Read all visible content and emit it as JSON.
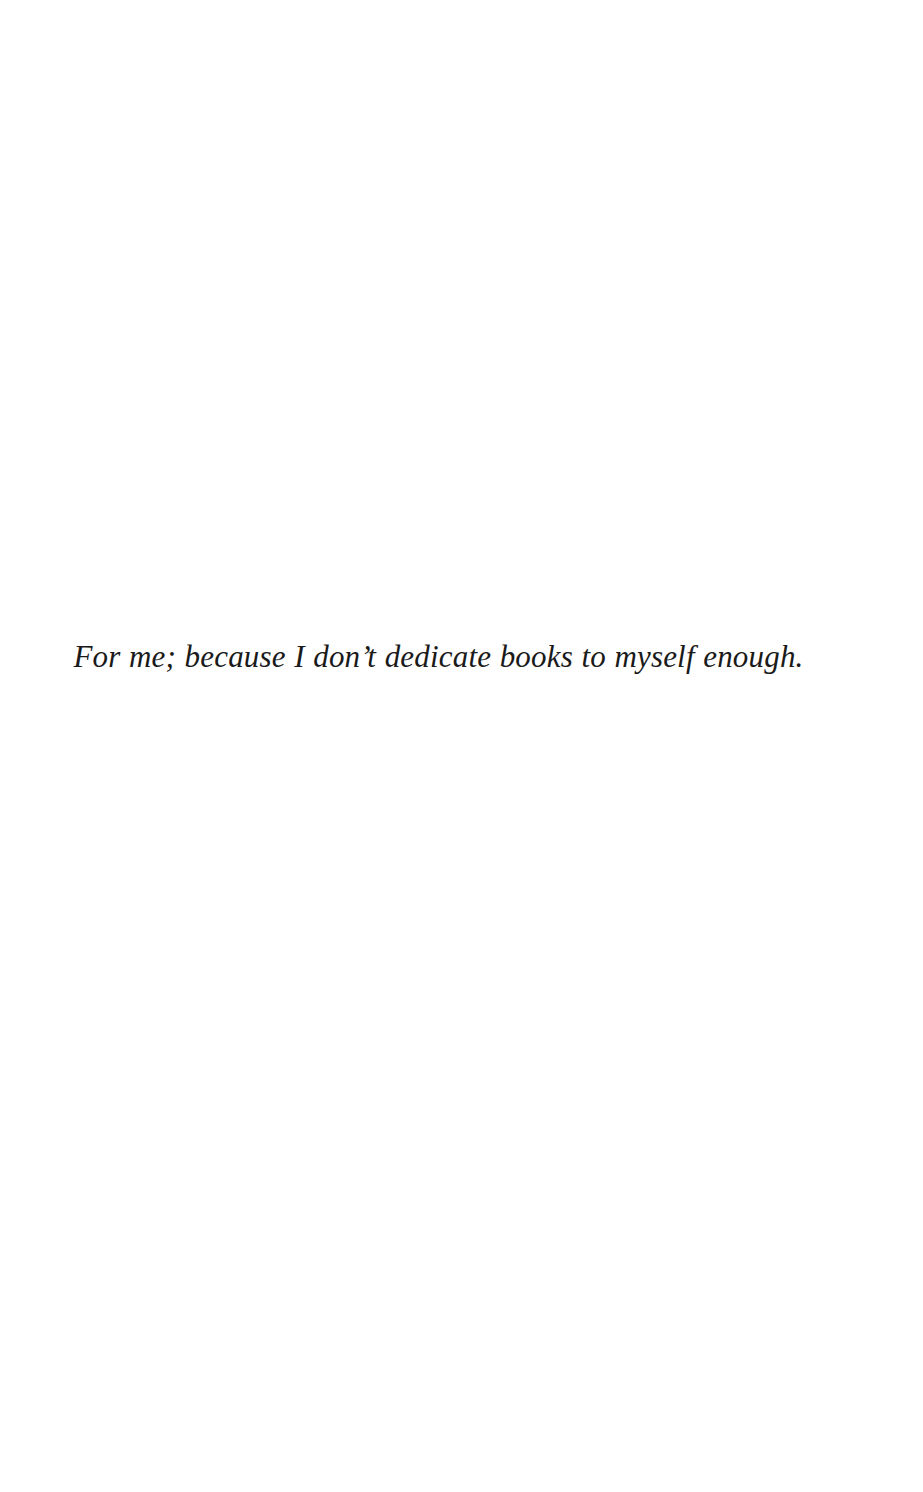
{
  "page": {
    "kind": "book-dedication-page",
    "width": 923,
    "height": 1492,
    "background_color": "#ffffff",
    "text_color": "#1a1a1a"
  },
  "dedication": {
    "text": "For me; because I don’t dedicate books to myself enough.",
    "style": "italic-serif",
    "alignment": "center"
  }
}
